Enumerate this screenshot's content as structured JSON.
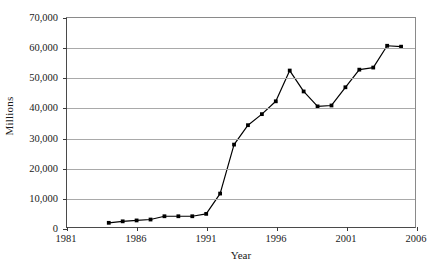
{
  "chart_data": {
    "type": "line",
    "title": "",
    "xlabel": "Year",
    "ylabel": "Millions",
    "xlim": [
      1981,
      2006
    ],
    "ylim": [
      0,
      70000
    ],
    "grid": true,
    "legend": false,
    "marker": "filled-square",
    "line_color": "#000000",
    "xticks": [
      1981,
      1986,
      1991,
      1996,
      2001,
      2006
    ],
    "xticklabels": [
      "1981",
      "1986",
      "1991",
      "1996",
      "2001",
      "2006"
    ],
    "yticks": [
      0,
      10000,
      20000,
      30000,
      40000,
      50000,
      60000,
      70000
    ],
    "yticklabels": [
      "0",
      "10,000",
      "20,000",
      "30,000",
      "40,000",
      "50,000",
      "60,000",
      "70,000"
    ],
    "x": [
      1984,
      1985,
      1986,
      1987,
      1988,
      1989,
      1990,
      1991,
      1992,
      1993,
      1994,
      1995,
      1996,
      1997,
      1998,
      1999,
      2000,
      2001,
      2002,
      2003,
      2004,
      2005
    ],
    "values": [
      1400,
      1900,
      2200,
      2500,
      3600,
      3600,
      3600,
      4400,
      11200,
      27600,
      34100,
      37800,
      42100,
      52400,
      45400,
      40400,
      40700,
      46800,
      52700,
      53400,
      60700,
      60400
    ],
    "series": [
      {
        "name": "Millions",
        "points": [
          {
            "x": 1984,
            "y": 1400
          },
          {
            "x": 1985,
            "y": 1900
          },
          {
            "x": 1986,
            "y": 2200
          },
          {
            "x": 1987,
            "y": 2500
          },
          {
            "x": 1988,
            "y": 3600
          },
          {
            "x": 1989,
            "y": 3600
          },
          {
            "x": 1990,
            "y": 3600
          },
          {
            "x": 1991,
            "y": 4400
          },
          {
            "x": 1992,
            "y": 11200
          },
          {
            "x": 1993,
            "y": 27600
          },
          {
            "x": 1994,
            "y": 34100
          },
          {
            "x": 1995,
            "y": 37800
          },
          {
            "x": 1996,
            "y": 42100
          },
          {
            "x": 1997,
            "y": 52400
          },
          {
            "x": 1998,
            "y": 45400
          },
          {
            "x": 1999,
            "y": 40400
          },
          {
            "x": 2000,
            "y": 40700
          },
          {
            "x": 2001,
            "y": 46800
          },
          {
            "x": 2002,
            "y": 52700
          },
          {
            "x": 2003,
            "y": 53400
          },
          {
            "x": 2004,
            "y": 60700
          },
          {
            "x": 2005,
            "y": 60400
          }
        ]
      }
    ]
  }
}
